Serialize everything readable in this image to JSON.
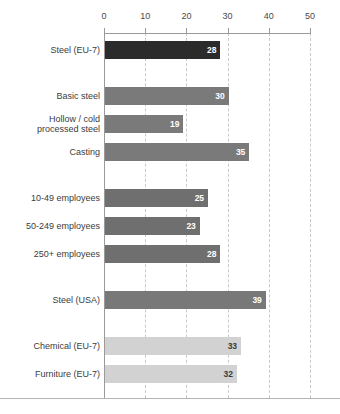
{
  "chart_data": {
    "type": "bar",
    "orientation": "horizontal",
    "title": "",
    "subtitle": "",
    "xlabel": "",
    "ylabel": "",
    "xlim": [
      0,
      50
    ],
    "xticks": [
      0,
      10,
      20,
      30,
      40,
      50
    ],
    "xtick_labels": [
      "0",
      "10",
      "20",
      "30",
      "40",
      "50"
    ],
    "grid": "vertical-dashed",
    "legend": "none",
    "categories": [
      "Steel (EU-7)",
      "Basic steel",
      "Hollow / cold processed steel",
      "Casting",
      "10-49 employees",
      "50-249 employees",
      "250+ employees",
      "Steel (USA)",
      "Chemical (EU-7)",
      "Furniture (EU-7)"
    ],
    "values": [
      28,
      30,
      19,
      35,
      25,
      23,
      28,
      39,
      33,
      32
    ],
    "groups": [
      {
        "name": "headline",
        "bars": [
          {
            "label": "Steel (EU-7)",
            "label_lines": [
              "Steel (EU-7)"
            ],
            "value": 28,
            "value_text": "28",
            "color": "#2b2b2b",
            "value_color": "#ffffff"
          }
        ]
      },
      {
        "name": "by-subsector",
        "bars": [
          {
            "label": "Basic steel",
            "label_lines": [
              "Basic steel"
            ],
            "value": 30,
            "value_text": "30",
            "color": "#7a7a7a",
            "value_color": "#ffffff"
          },
          {
            "label": "Hollow / cold processed steel",
            "label_lines": [
              "Hollow / cold",
              "processed steel"
            ],
            "value": 19,
            "value_text": "19",
            "color": "#7a7a7a",
            "value_color": "#ffffff"
          },
          {
            "label": "Casting",
            "label_lines": [
              "Casting"
            ],
            "value": 35,
            "value_text": "35",
            "color": "#7a7a7a",
            "value_color": "#ffffff"
          }
        ]
      },
      {
        "name": "by-firm-size",
        "bars": [
          {
            "label": "10-49 employees",
            "label_lines": [
              "10-49 employees"
            ],
            "value": 25,
            "value_text": "25",
            "color": "#6f6f6f",
            "value_color": "#ffffff"
          },
          {
            "label": "50-249 employees",
            "label_lines": [
              "50-249 employees"
            ],
            "value": 23,
            "value_text": "23",
            "color": "#6f6f6f",
            "value_color": "#ffffff"
          },
          {
            "label": "250+ employees",
            "label_lines": [
              "250+ employees"
            ],
            "value": 28,
            "value_text": "28",
            "color": "#6f6f6f",
            "value_color": "#ffffff"
          }
        ]
      },
      {
        "name": "benchmark-region",
        "bars": [
          {
            "label": "Steel (USA)",
            "label_lines": [
              "Steel (USA)"
            ],
            "value": 39,
            "value_text": "39",
            "color": "#787878",
            "value_color": "#ffffff"
          }
        ]
      },
      {
        "name": "benchmark-sector",
        "bars": [
          {
            "label": "Chemical (EU-7)",
            "label_lines": [
              "Chemical (EU-7)"
            ],
            "value": 33,
            "value_text": "33",
            "color": "#d2d2d2",
            "value_color": "#3a3a3a"
          },
          {
            "label": "Furniture (EU-7)",
            "label_lines": [
              "Furniture (EU-7)"
            ],
            "value": 32,
            "value_text": "32",
            "color": "#d2d2d2",
            "value_color": "#3a3a3a"
          }
        ]
      }
    ],
    "colors": {
      "highlight_bar": "#2b2b2b",
      "primary_bar": "#7a7a7a",
      "light_bar": "#d2d2d2",
      "gridline": "#c9c9c9",
      "axis": "#9a9a9a",
      "text": "#3a3a3a",
      "plot_background": "#ffffff"
    }
  }
}
